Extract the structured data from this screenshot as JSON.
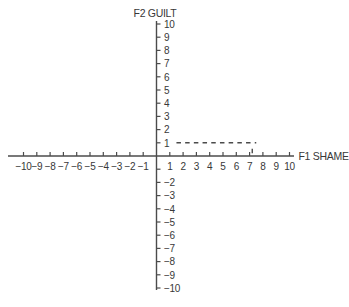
{
  "figure": {
    "background": "#ffffff",
    "axis_color": "#4b4b4b",
    "text_color": "#383838",
    "dash_color": "#4b4b4b"
  },
  "chart_data": {
    "type": "line",
    "title": "",
    "xlabel": "F1 SHAME",
    "ylabel": "F2 GUILT",
    "xlim": [
      -10,
      10
    ],
    "ylim": [
      -10,
      10
    ],
    "grid": false,
    "legend": false,
    "x_ticks_labeled": [
      -10,
      -9,
      -8,
      -7,
      -6,
      -5,
      -4,
      -3,
      -2,
      -1,
      1,
      2,
      3,
      4,
      5,
      6,
      7,
      8,
      9,
      10
    ],
    "y_ticks_labeled": [
      10,
      9,
      8,
      7,
      6,
      5,
      4,
      3,
      2,
      1,
      -2,
      -3,
      -4,
      -5,
      -6,
      -7,
      -8,
      -9,
      -10
    ],
    "y_ticks_unlabeled": [
      -1
    ],
    "series": [],
    "annotations": [
      {
        "kind": "dashed-horizontal-line",
        "y": 1,
        "x_start": 1.5,
        "x_end": 7.5,
        "note": "dashed line at guilt level 1 running from beside the y-axis '1' label to about x = 7.5"
      },
      {
        "kind": "vertical-dash",
        "x": 7.2,
        "y_start": 0.2,
        "y_end": 0.55,
        "note": "short vertical dash just above the x-axis below the end of the dashed line"
      }
    ]
  }
}
